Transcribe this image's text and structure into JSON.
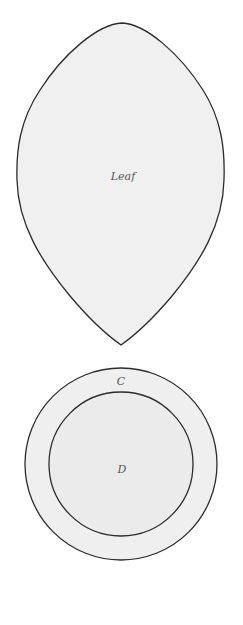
{
  "diagram": {
    "leaf": {
      "label": "Leaf",
      "fill": "#f0f0f0",
      "stroke": "#2b2b2b"
    },
    "outer_circle": {
      "label": "C",
      "fill": "#efefef",
      "stroke": "#2b2b2b"
    },
    "inner_circle": {
      "label": "D",
      "fill": "#ebebeb",
      "stroke": "#2b2b2b"
    }
  }
}
